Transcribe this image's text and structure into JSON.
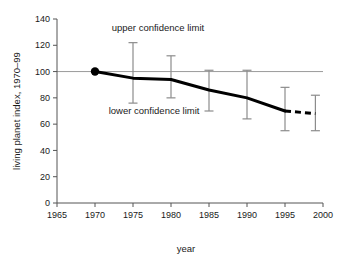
{
  "chart_data": {
    "type": "line",
    "title": "",
    "xlabel": "year",
    "ylabel": "living planet index, 1970–99",
    "xlim": [
      1965,
      2000
    ],
    "ylim": [
      0,
      140
    ],
    "xticks": [
      1965,
      1970,
      1975,
      1980,
      1985,
      1990,
      1995,
      2000
    ],
    "yticks": [
      0,
      20,
      40,
      60,
      80,
      100,
      120,
      140
    ],
    "grid": false,
    "reference_line": {
      "y": 100,
      "color": "#9a9a9a"
    },
    "legend": "none",
    "x": [
      1970,
      1975,
      1980,
      1985,
      1990,
      1995,
      1999
    ],
    "series": [
      {
        "name": "living planet index",
        "style": "solid-then-dashed",
        "dashed_from": 1995,
        "color": "#000000",
        "values": [
          100,
          95,
          94,
          86,
          80,
          70,
          68
        ]
      }
    ],
    "markers": [
      {
        "x": 1970,
        "y": 100,
        "shape": "circle",
        "color": "#000000"
      }
    ],
    "error_bars": {
      "color": "#8c8c8c",
      "x": [
        1975,
        1980,
        1985,
        1990,
        1995,
        1999
      ],
      "upper": [
        122,
        112,
        101,
        101,
        88,
        82
      ],
      "lower": [
        76,
        80,
        70,
        64,
        55,
        55
      ]
    },
    "annotations": [
      {
        "text": "upper confidence limit",
        "x": 1972.2,
        "y": 131,
        "anchor": "start"
      },
      {
        "text": "lower confidence limit",
        "x": 1971.8,
        "y": 68,
        "anchor": "start"
      }
    ]
  },
  "axis": {
    "x_title": "year",
    "y_title": "living planet index, 1970–99",
    "xticks": [
      "1965",
      "1970",
      "1975",
      "1980",
      "1985",
      "1990",
      "1995",
      "2000"
    ],
    "yticks": [
      "140",
      "120",
      "100",
      "80",
      "60",
      "40",
      "20",
      "0"
    ]
  },
  "annotations": {
    "upper": "upper confidence limit",
    "lower": "lower confidence limit"
  },
  "colors": {
    "line": "#000000",
    "error_bar": "#8c8c8c",
    "reference": "#9a9a9a",
    "axis": "#555555",
    "text": "#1a1a1a",
    "background": "#ffffff"
  }
}
